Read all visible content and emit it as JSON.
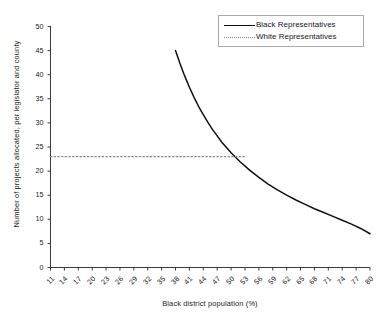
{
  "chart_data": {
    "type": "line",
    "title": "",
    "xlabel": "Black district population (%)",
    "ylabel": "Number of projects allocated, per legislator and county",
    "xlim": [
      11,
      80
    ],
    "ylim": [
      0,
      50
    ],
    "grid": false,
    "legend_position": "top-right",
    "x_ticks": [
      11,
      14,
      17,
      20,
      23,
      26,
      29,
      32,
      35,
      38,
      41,
      44,
      47,
      50,
      53,
      56,
      59,
      62,
      65,
      68,
      71,
      74,
      77,
      80
    ],
    "y_ticks": [
      0,
      5,
      10,
      15,
      20,
      25,
      30,
      35,
      40,
      45,
      50
    ],
    "series": [
      {
        "name": "Black Representatives",
        "style": "solid",
        "color": "#111111",
        "x": [
          38,
          39,
          40,
          41,
          42,
          43,
          44,
          45,
          46,
          47,
          48,
          49,
          50,
          52,
          54,
          56,
          58,
          60,
          62,
          64,
          66,
          68,
          70,
          72,
          74,
          76,
          78,
          80
        ],
        "y": [
          45.0,
          42.2,
          39.7,
          37.4,
          35.3,
          33.4,
          31.7,
          30.1,
          28.6,
          27.3,
          26.0,
          24.9,
          23.8,
          21.9,
          20.2,
          18.7,
          17.3,
          16.1,
          15.0,
          14.0,
          13.1,
          12.2,
          11.4,
          10.6,
          9.8,
          9.0,
          8.1,
          7.0
        ]
      },
      {
        "name": "White Representatives",
        "style": "dotted",
        "color": "#8a8a8a",
        "x": [
          11,
          53
        ],
        "y": [
          23.0,
          23.0
        ]
      }
    ],
    "annotations": [
      {
        "text": "dotted line terminates at intersection with solid curve near 53% population",
        "x": 53,
        "y": 23
      }
    ]
  },
  "legend": {
    "entries": [
      {
        "label": "Black Representatives",
        "style": "solid"
      },
      {
        "label": "White Representatives",
        "style": "dotted"
      }
    ]
  }
}
